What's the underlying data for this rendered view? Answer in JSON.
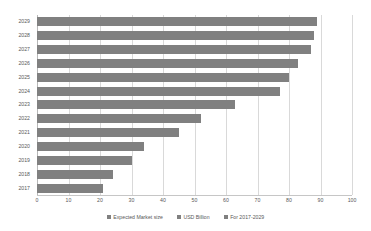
{
  "chart_data": {
    "type": "bar",
    "orientation": "horizontal",
    "title": "",
    "xlabel": "",
    "ylabel": "",
    "xlim": [
      0,
      100
    ],
    "xticks": [
      0,
      10,
      20,
      30,
      40,
      50,
      60,
      70,
      80,
      90,
      100
    ],
    "grid": true,
    "legend_position": "bottom",
    "categories": [
      "2029",
      "2028",
      "2027",
      "2026",
      "2025",
      "2024",
      "2023",
      "2022",
      "2021",
      "2020",
      "2019",
      "2018",
      "2017"
    ],
    "values": [
      89,
      88,
      87,
      83,
      80,
      77,
      63,
      52,
      45,
      34,
      30,
      24,
      21
    ],
    "series": [
      {
        "name": "Expected Market size",
        "color": "#808080",
        "values": [
          89,
          88,
          87,
          83,
          80,
          77,
          63,
          52,
          45,
          34,
          30,
          24,
          21
        ]
      }
    ],
    "legend": [
      {
        "label": "Expected Market size",
        "color": "#808080"
      },
      {
        "label": "USD Billion",
        "color": "#808080"
      },
      {
        "label": "For 2017-2029",
        "color": "#808080"
      }
    ]
  },
  "colors": {
    "bar": "#808080",
    "grid": "#d9d9d9",
    "axis": "#b8b8b8",
    "text": "#595959",
    "background": "#ffffff"
  }
}
